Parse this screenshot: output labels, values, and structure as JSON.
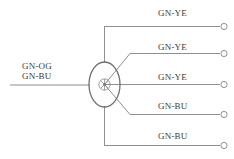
{
  "diagram": {
    "type": "wiring-splice-diagram",
    "colors": {
      "wire_line": "#8e8e94",
      "splice_ellipse": "#6f6f76",
      "terminal_outline": "#8e8e94",
      "label_text": "#3c3c3c",
      "background": "#ffffff"
    },
    "splice": {
      "name": "splice-node",
      "center_x": 104.5,
      "center_y": 84.5,
      "ellipse_rx": 15.5,
      "ellipse_ry": 22.5,
      "inner_circle_r": 5.5,
      "core_dot_r": 1.6
    },
    "input": {
      "name": "input-wire",
      "label_line1": "GN-OG",
      "label_line2": "GN-BU",
      "label_x": 22,
      "label_y": 62,
      "line_start_x": 10,
      "line_end_x": 89,
      "line_y": 85
    },
    "bus": {
      "vertical_x": 104.5,
      "top_y": 26.5,
      "bottom_y": 145.5
    },
    "outputs": [
      {
        "name": "output-wire-1",
        "label": "GN-YE",
        "label_x": 158,
        "label_y": 8,
        "route": "vertical-top",
        "line_y": 26.5,
        "line_start_x": 104.5,
        "line_end_x": 219,
        "terminal_cx": 224,
        "terminal_cy": 26.5
      },
      {
        "name": "output-wire-2",
        "label": "GN-YE",
        "label_x": 158,
        "label_y": 43,
        "route": "diagonal-upper",
        "line_y": 53.5,
        "diag_from_x": 104.5,
        "diag_from_y": 84.5,
        "diag_to_x": 130,
        "line_end_x": 219,
        "terminal_cx": 224,
        "terminal_cy": 53.5
      },
      {
        "name": "output-wire-3",
        "label": "GN-YE",
        "label_x": 158,
        "label_y": 73,
        "route": "straight-middle",
        "line_y": 84.5,
        "line_start_x": 120,
        "line_end_x": 219,
        "terminal_cx": 224,
        "terminal_cy": 84.5
      },
      {
        "name": "output-wire-4",
        "label": "GN-BU",
        "label_x": 158,
        "label_y": 101,
        "route": "diagonal-lower",
        "line_y": 114.5,
        "diag_from_x": 104.5,
        "diag_from_y": 84.5,
        "diag_to_x": 130,
        "line_end_x": 219,
        "terminal_cx": 224,
        "terminal_cy": 114.5
      },
      {
        "name": "output-wire-5",
        "label": "GN-BU",
        "label_x": 158,
        "label_y": 131,
        "route": "vertical-bottom",
        "line_y": 145.5,
        "line_start_x": 104.5,
        "line_end_x": 219,
        "terminal_cx": 224,
        "terminal_cy": 145.5
      }
    ]
  }
}
